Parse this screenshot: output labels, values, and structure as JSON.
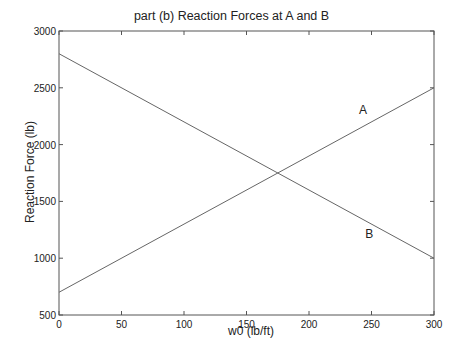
{
  "chart_data": {
    "type": "line",
    "title": "part (b) Reaction Forces at A and B",
    "xlabel": "w0 (lb/ft)",
    "ylabel": "Reaction Force (lb)",
    "xlim": [
      0,
      300
    ],
    "ylim": [
      500,
      3000
    ],
    "xticks": [
      0,
      50,
      100,
      150,
      200,
      250,
      300
    ],
    "yticks": [
      500,
      1000,
      1500,
      2000,
      2500,
      3000
    ],
    "grid": false,
    "series": [
      {
        "name": "A",
        "x": [
          0,
          300
        ],
        "y": [
          700,
          2500
        ],
        "label_pos": [
          240,
          2270
        ]
      },
      {
        "name": "B",
        "x": [
          0,
          300
        ],
        "y": [
          2800,
          1000
        ],
        "label_pos": [
          245,
          1180
        ]
      }
    ],
    "annotations": [
      "A",
      "B"
    ]
  }
}
